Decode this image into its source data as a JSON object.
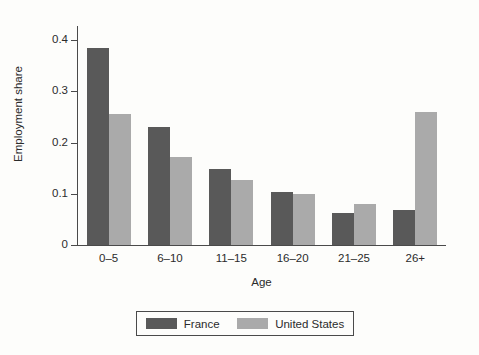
{
  "chart_data": {
    "type": "bar",
    "title": "",
    "subtitle": "",
    "xlabel": "Age",
    "ylabel": "Employment share",
    "categories": [
      "0–5",
      "6–10",
      "11–15",
      "16–20",
      "21–25",
      "26+"
    ],
    "series": [
      {
        "name": "France",
        "color": "#595959",
        "values": [
          0.385,
          0.231,
          0.148,
          0.103,
          0.062,
          0.068
        ]
      },
      {
        "name": "United States",
        "color": "#aaaaaa",
        "values": [
          0.256,
          0.172,
          0.127,
          0.099,
          0.08,
          0.259
        ]
      }
    ],
    "ylim": [
      0,
      0.42
    ],
    "yticks": [
      "0",
      "0.1",
      "0.2",
      "0.3",
      "0.4"
    ],
    "ytick_values": [
      0,
      0.1,
      0.2,
      0.3,
      0.4
    ],
    "grid": false,
    "legend_position": "bottom-center",
    "legend_entries": [
      "France",
      "United States"
    ]
  }
}
